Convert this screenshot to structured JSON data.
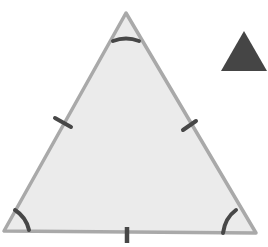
{
  "diagram": {
    "main_triangle": {
      "fill": "#ebebeb",
      "stroke": "#a9a9a9",
      "equal_side_marks": 3,
      "equal_angle_marks": 3
    },
    "mark_color": "#474747",
    "icon_triangle": {
      "fill": "#454545"
    }
  }
}
